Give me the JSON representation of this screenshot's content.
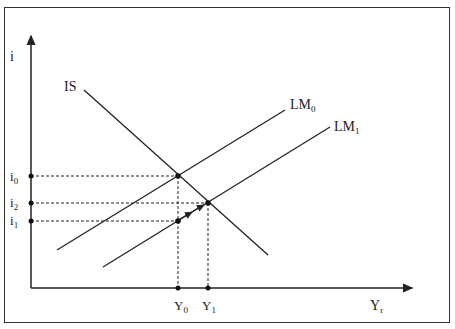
{
  "diagram": {
    "y_axis_label": "i",
    "x_axis_label": {
      "base": "Y",
      "sub": "r"
    },
    "curves": [
      {
        "id": "IS",
        "label": {
          "base": "IS",
          "sub": ""
        }
      },
      {
        "id": "LM0",
        "label": {
          "base": "LM",
          "sub": "0"
        }
      },
      {
        "id": "LM1",
        "label": {
          "base": "LM",
          "sub": "1"
        }
      }
    ],
    "y_ticks": [
      {
        "id": "i0",
        "base": "i",
        "sub": "0"
      },
      {
        "id": "i2",
        "base": "i",
        "sub": "2"
      },
      {
        "id": "i1",
        "base": "i",
        "sub": "1"
      }
    ],
    "x_ticks": [
      {
        "id": "Y0",
        "base": "Y",
        "sub": "0"
      },
      {
        "id": "Y1",
        "base": "Y",
        "sub": "1"
      }
    ],
    "points": [
      {
        "id": "E0",
        "x_tick": "Y0",
        "y_tick": "i0",
        "on": [
          "IS",
          "LM0"
        ]
      },
      {
        "id": "E1",
        "x_tick": "Y1",
        "y_tick": "i2",
        "on": [
          "IS",
          "LM1"
        ]
      },
      {
        "id": "E2",
        "x_tick": "Y0",
        "y_tick": "i1",
        "on": [
          "LM1"
        ]
      }
    ],
    "annotation": "arrows along LM1 from (Y0,i1) toward (Y1,i2)"
  }
}
